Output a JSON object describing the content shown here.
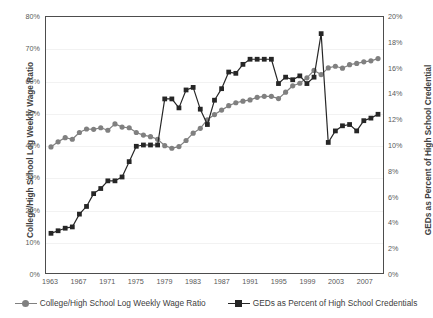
{
  "chart_data": {
    "type": "line",
    "title": "",
    "xlabel": "",
    "ylabel": "College/High School Log Weekly Wage Ratio",
    "ylabel_secondary": "GEDs as Percent of High School Credential",
    "grid": true,
    "legend_position": "bottom",
    "x": [
      1963,
      1964,
      1965,
      1966,
      1967,
      1968,
      1969,
      1970,
      1971,
      1972,
      1973,
      1974,
      1975,
      1976,
      1977,
      1978,
      1979,
      1980,
      1981,
      1982,
      1983,
      1984,
      1985,
      1986,
      1987,
      1988,
      1989,
      1990,
      1991,
      1992,
      1993,
      1994,
      1995,
      1996,
      1997,
      1998,
      1999,
      2000,
      2001,
      2002,
      2003,
      2004,
      2005,
      2006,
      2007,
      2008,
      2009
    ],
    "xtick_labels": [
      "1963",
      "1967",
      "1971",
      "1975",
      "1979",
      "1983",
      "1987",
      "1991",
      "1995",
      "1999",
      "2003",
      "2007"
    ],
    "xtick_values": [
      1963,
      1967,
      1971,
      1975,
      1979,
      1983,
      1987,
      1991,
      1995,
      1999,
      2003,
      2007
    ],
    "xlim": [
      1962.3,
      2009.7
    ],
    "ylim": [
      0,
      80
    ],
    "ytick_labels": [
      "0%",
      "10%",
      "20%",
      "30%",
      "40%",
      "50%",
      "60%",
      "70%",
      "80%"
    ],
    "ytick_values": [
      0,
      10,
      20,
      30,
      40,
      50,
      60,
      70,
      80
    ],
    "ylim_secondary": [
      0,
      20
    ],
    "ytick_labels_secondary": [
      "0%",
      "2%",
      "4%",
      "6%",
      "8%",
      "10%",
      "12%",
      "14%",
      "16%",
      "18%",
      "20%"
    ],
    "ytick_values_secondary": [
      0,
      2,
      4,
      6,
      8,
      10,
      12,
      14,
      16,
      18,
      20
    ],
    "series": [
      {
        "name": "College/High School Log Weekly Wage Ratio",
        "axis": "left",
        "color": "#808080",
        "marker": "circle",
        "values": [
          39.4,
          41.0,
          42.3,
          41.8,
          43.9,
          45.0,
          44.9,
          45.4,
          44.6,
          46.6,
          45.6,
          45.4,
          43.9,
          43.1,
          42.6,
          41.8,
          39.8,
          39.0,
          39.5,
          41.4,
          43.7,
          45.2,
          47.9,
          49.5,
          50.9,
          52.3,
          53.2,
          53.7,
          54.1,
          54.9,
          55.2,
          55.2,
          54.5,
          56.5,
          58.5,
          59.3,
          61.0,
          63.3,
          62.0,
          64.1,
          64.6,
          64.0,
          65.1,
          65.5,
          66.0,
          66.3,
          67.0
        ]
      },
      {
        "name": "GEDs as Percent of High School Credentials",
        "axis": "right",
        "color": "#262626",
        "marker": "square",
        "values": [
          3.1,
          3.3,
          3.5,
          3.6,
          4.6,
          5.2,
          6.2,
          6.6,
          7.2,
          7.2,
          7.5,
          8.7,
          9.9,
          10.0,
          10.0,
          10.0,
          13.6,
          13.6,
          12.9,
          14.3,
          14.5,
          12.8,
          11.6,
          13.5,
          14.4,
          15.7,
          15.6,
          16.3,
          16.7,
          16.7,
          16.7,
          16.7,
          14.8,
          15.3,
          15.1,
          15.4,
          14.8,
          15.3,
          18.7,
          10.2,
          11.1,
          11.5,
          11.6,
          11.1,
          11.9,
          12.1,
          12.4
        ]
      }
    ]
  }
}
